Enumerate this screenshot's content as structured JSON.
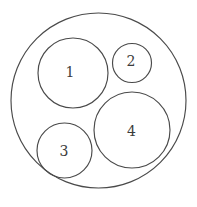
{
  "figure": {
    "canvas": {
      "width": 197,
      "height": 207
    },
    "stroke_color": "#4a4a4a",
    "label_color": "#3c3c3c",
    "background_color": "#ffffff"
  },
  "chart_data": {
    "type": "diagram",
    "subtype": "circle-packing",
    "grid": false,
    "legend": null,
    "container": {
      "name": "outer-boundary-circle",
      "label": "",
      "cx": 98.5,
      "cy": 100.5,
      "r": 87.5
    },
    "circles": [
      {
        "label": "1",
        "cx": 73.0,
        "cy": 73.0,
        "r": 35.0,
        "label_x": 70.0,
        "label_y": 72.0
      },
      {
        "label": "2",
        "cx": 132.0,
        "cy": 63.0,
        "r": 19.5,
        "label_x": 131.0,
        "label_y": 61.0
      },
      {
        "label": "3",
        "cx": 64.5,
        "cy": 150.5,
        "r": 27.5,
        "label_x": 64.0,
        "label_y": 151.0
      },
      {
        "label": "4",
        "cx": 132.0,
        "cy": 130.0,
        "r": 38.0,
        "label_x": 131.5,
        "label_y": 131.0
      }
    ]
  }
}
